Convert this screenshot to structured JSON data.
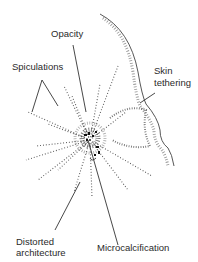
{
  "labels": {
    "opacity": "Opacity",
    "spiculations": "Spiculations",
    "skin_line1": "Skin",
    "skin_line2": "tethering",
    "distorted_line1": "Distorted",
    "distorted_line2": "architecture",
    "microcalcification": "Microcalcification"
  },
  "colors": {
    "ink": "#2a2a2a",
    "background": "#ffffff"
  }
}
